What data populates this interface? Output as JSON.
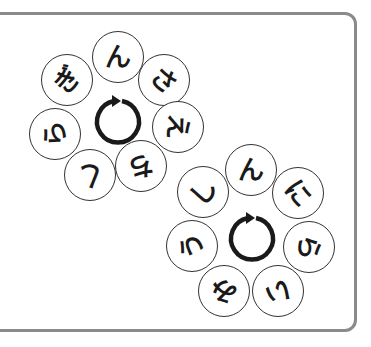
{
  "puzzle": {
    "type": "hiragana-ring-word-puzzle",
    "frame_color": "#8a8a8a",
    "rings": [
      {
        "id": "ring-1",
        "center": [
          118,
          120
        ],
        "tiles": [
          {
            "char": "ん",
            "x": 118,
            "y": 57,
            "rot": 0
          },
          {
            "char": "さ",
            "x": 164,
            "y": 80,
            "rot": 40
          },
          {
            "char": "え",
            "x": 178,
            "y": 127,
            "rot": 95
          },
          {
            "char": "ち",
            "x": 141,
            "y": 166,
            "rot": 170
          },
          {
            "char": "し",
            "x": 90,
            "y": 175,
            "rot": 200
          },
          {
            "char": "ら",
            "x": 55,
            "y": 134,
            "rot": 260
          },
          {
            "char": "ぎ",
            "x": 67,
            "y": 80,
            "rot": 310
          }
        ]
      },
      {
        "id": "ring-2",
        "center": [
          252,
          237
        ],
        "tiles": [
          {
            "char": "ん",
            "x": 251,
            "y": 170,
            "rot": 0
          },
          {
            "char": "に",
            "x": 298,
            "y": 193,
            "rot": 50
          },
          {
            "char": "ら",
            "x": 309,
            "y": 247,
            "rot": 100
          },
          {
            "char": "い",
            "x": 278,
            "y": 291,
            "rot": 170
          },
          {
            "char": "み",
            "x": 224,
            "y": 291,
            "rot": 200
          },
          {
            "char": "う",
            "x": 192,
            "y": 246,
            "rot": 260
          },
          {
            "char": "し",
            "x": 203,
            "y": 192,
            "rot": 310
          }
        ]
      }
    ],
    "cycle_icon": "clockwise-rotation-arrow"
  }
}
